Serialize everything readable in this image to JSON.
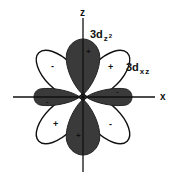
{
  "diagram": {
    "axes": {
      "z_label": "z",
      "x_label": "x"
    },
    "orbitals": [
      {
        "name": "3d",
        "subscript": "z",
        "superscript": "2",
        "fill": "#3a3a3a",
        "lobes": [
          {
            "position": "top",
            "sign": "+"
          },
          {
            "position": "bottom",
            "sign": "+"
          },
          {
            "position": "left",
            "sign": "-"
          },
          {
            "position": "right",
            "sign": "-"
          }
        ]
      },
      {
        "name": "3d",
        "subscript": "xz",
        "superscript": "",
        "fill": "#ffffff",
        "lobes": [
          {
            "position": "upper-left",
            "sign": "-"
          },
          {
            "position": "upper-right",
            "sign": "+"
          },
          {
            "position": "lower-left",
            "sign": "+"
          },
          {
            "position": "lower-right",
            "sign": "-"
          }
        ]
      }
    ],
    "colors": {
      "line": "#111111",
      "dark_lobe": "#3a3a3a",
      "background": "#ffffff"
    }
  }
}
